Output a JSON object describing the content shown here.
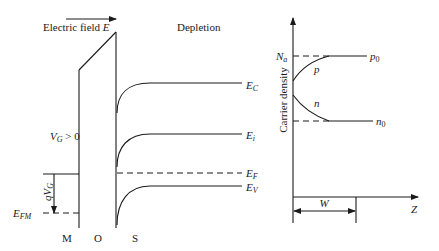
{
  "band_diagram": {
    "field_label": "Electric field ",
    "field_symbol": "E",
    "region_label": "Depletion",
    "gate_bias": {
      "symbol": "V",
      "sub": "G",
      "rest": " > 0"
    },
    "gate_shift": {
      "prefix": "qV",
      "sub": "G"
    },
    "bands": {
      "conduction": {
        "symbol": "E",
        "sub": "C"
      },
      "intrinsic": {
        "symbol": "E",
        "sub": "i"
      },
      "fermi": {
        "symbol": "E",
        "sub": "F"
      },
      "valence": {
        "symbol": "E",
        "sub": "V"
      }
    },
    "metal_fermi": {
      "symbol": "E",
      "sub": "FM"
    },
    "layers": [
      "M",
      "O",
      "S"
    ]
  },
  "carrier_plot": {
    "ylabel": "Carrier density",
    "xlabel": "Z",
    "acceptor": {
      "symbol": "N",
      "sub": "a"
    },
    "hole_bulk": {
      "symbol": "p",
      "sub": "0"
    },
    "electron_bulk": {
      "symbol": "n",
      "sub": "0"
    },
    "hole_curve_label": "p",
    "electron_curve_label": "n",
    "width_label": "W"
  }
}
